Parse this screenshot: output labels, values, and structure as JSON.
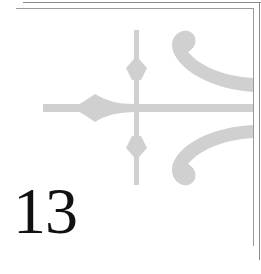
{
  "page": {
    "chapter_number": "13"
  },
  "colors": {
    "ornament": "#d0d0d0",
    "border": "#8a8a8a",
    "text": "#111111"
  }
}
